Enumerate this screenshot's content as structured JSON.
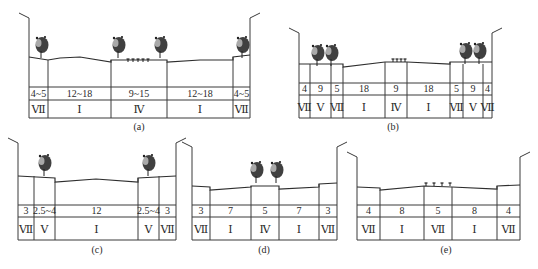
{
  "colors": {
    "line": "#3a3a3a",
    "tree": "#1e1e1e",
    "text": "#2a2a2a",
    "background": "#ffffff"
  },
  "diagrams": [
    {
      "id": "a",
      "caption": "(a)",
      "caption_xy": [
        139,
        130
      ],
      "top": 57,
      "row1": 87,
      "row2": 100,
      "bottom": 118,
      "pole_top": 18,
      "columns": [
        29,
        48,
        111,
        167,
        233,
        250
      ],
      "widths": [
        "4~5",
        "12~18",
        "9~15",
        "12~18",
        "4~5"
      ],
      "classes": [
        "Ⅶ",
        "Ⅰ",
        "Ⅳ",
        "Ⅰ",
        "Ⅶ"
      ],
      "ground": [
        [
          29,
          57
        ],
        [
          48,
          60
        ],
        [
          60,
          58
        ],
        [
          80,
          57
        ],
        [
          111,
          62
        ],
        [
          111,
          60
        ],
        [
          167,
          60
        ],
        [
          167,
          62
        ],
        [
          200,
          60
        ],
        [
          233,
          60
        ],
        [
          233,
          57
        ],
        [
          250,
          55
        ]
      ],
      "trees": [
        [
          41,
          47
        ],
        [
          118,
          47
        ],
        [
          160,
          47
        ],
        [
          242,
          47
        ]
      ],
      "lamps": [
        [
          128,
          61
        ],
        [
          133,
          61
        ],
        [
          138,
          61
        ],
        [
          143,
          61
        ],
        [
          148,
          61
        ]
      ]
    },
    {
      "id": "b",
      "caption": "(b)",
      "caption_xy": [
        393,
        130
      ],
      "top": 64,
      "row1": 83,
      "row2": 95,
      "bottom": 118,
      "pole_top": 33,
      "columns": [
        299,
        310,
        331,
        343,
        385,
        407,
        450,
        463,
        483,
        492
      ],
      "widths": [
        "4",
        "9",
        "5",
        "18",
        "9",
        "18",
        "5",
        "9",
        "4"
      ],
      "classes": [
        "Ⅶ",
        "Ⅴ",
        "Ⅶ",
        "Ⅰ",
        "Ⅳ",
        "Ⅰ",
        "Ⅶ",
        "Ⅴ",
        "Ⅶ"
      ],
      "ground": [
        [
          299,
          64
        ],
        [
          343,
          64
        ],
        [
          343,
          67
        ],
        [
          385,
          62
        ],
        [
          407,
          62
        ],
        [
          450,
          64
        ],
        [
          450,
          62
        ],
        [
          492,
          62
        ]
      ],
      "trees": [
        [
          317,
          55
        ],
        [
          331,
          55
        ],
        [
          465,
          53
        ],
        [
          479,
          53
        ]
      ],
      "lamps": [
        [
          393,
          61
        ],
        [
          397,
          61
        ],
        [
          401,
          61
        ],
        [
          405,
          61
        ]
      ]
    },
    {
      "id": "c",
      "caption": "(c)",
      "caption_xy": [
        97,
        253
      ],
      "top": 176,
      "row1": 205,
      "row2": 217,
      "bottom": 240,
      "pole_top": 143,
      "columns": [
        18,
        34,
        55,
        138,
        159,
        176
      ],
      "widths": [
        "3",
        "2.5~4",
        "12",
        "2.5~4",
        "3"
      ],
      "classes": [
        "Ⅶ",
        "Ⅴ",
        "Ⅰ",
        "Ⅴ",
        "Ⅶ"
      ],
      "ground": [
        [
          18,
          176
        ],
        [
          55,
          178
        ],
        [
          55,
          182
        ],
        [
          96,
          179
        ],
        [
          138,
          182
        ],
        [
          138,
          178
        ],
        [
          176,
          176
        ]
      ],
      "trees": [
        [
          44,
          165
        ],
        [
          148,
          165
        ]
      ],
      "lamps": []
    },
    {
      "id": "d",
      "caption": "(d)",
      "caption_xy": [
        264,
        253
      ],
      "top": 186,
      "row1": 205,
      "row2": 217,
      "bottom": 240,
      "pole_top": 147,
      "columns": [
        192,
        210,
        251,
        279,
        319,
        337
      ],
      "widths": [
        "3",
        "7",
        "5",
        "7",
        "3"
      ],
      "classes": [
        "Ⅶ",
        "Ⅰ",
        "Ⅳ",
        "Ⅰ",
        "Ⅶ"
      ],
      "ground": [
        [
          192,
          186
        ],
        [
          210,
          187
        ],
        [
          210,
          190
        ],
        [
          251,
          187
        ],
        [
          251,
          186
        ],
        [
          279,
          186
        ],
        [
          279,
          189
        ],
        [
          319,
          187
        ],
        [
          319,
          184
        ],
        [
          337,
          183
        ]
      ],
      "trees": [
        [
          256,
          172
        ],
        [
          276,
          172
        ]
      ],
      "lamps": []
    },
    {
      "id": "e",
      "caption": "(e)",
      "caption_xy": [
        446,
        253
      ],
      "top": 187,
      "row1": 205,
      "row2": 217,
      "bottom": 240,
      "pole_top": 157,
      "columns": [
        357,
        380,
        424,
        452,
        497,
        520
      ],
      "widths": [
        "4",
        "8",
        "5",
        "8",
        "4"
      ],
      "classes": [
        "Ⅶ",
        "Ⅰ",
        "Ⅶ",
        "Ⅰ",
        "Ⅶ"
      ],
      "ground": [
        [
          357,
          187
        ],
        [
          380,
          188
        ],
        [
          380,
          190
        ],
        [
          424,
          186
        ],
        [
          452,
          187
        ],
        [
          497,
          189
        ],
        [
          497,
          186
        ],
        [
          520,
          185
        ]
      ],
      "trees": [],
      "lamps": [
        [
          426,
          185
        ],
        [
          434,
          185
        ],
        [
          442,
          185
        ],
        [
          450,
          185
        ]
      ]
    }
  ]
}
